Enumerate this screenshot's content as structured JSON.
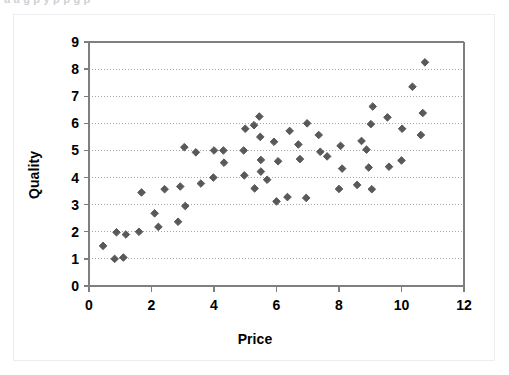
{
  "top_clipped_text": "a a g       p  y p      p      g p",
  "chart_data": {
    "type": "scatter",
    "title": "",
    "xlabel": "Price",
    "ylabel": "Quality",
    "xlim": [
      0,
      12
    ],
    "ylim": [
      0,
      9
    ],
    "xticks": [
      0,
      2,
      4,
      6,
      8,
      10,
      12
    ],
    "xtick_labels": [
      "0",
      "2",
      "4",
      "6",
      "8",
      "10",
      "12"
    ],
    "yticks": [
      0,
      1,
      2,
      3,
      4,
      5,
      6,
      7,
      8,
      9
    ],
    "ytick_labels": [
      "0",
      "1",
      "2",
      "3",
      "4",
      "5",
      "6",
      "7",
      "8",
      "9"
    ],
    "grid": "horizontal-dotted",
    "legend": null,
    "marker": "diamond",
    "marker_color": "#595959",
    "marker_size": 6,
    "axis_color": "#808080",
    "grid_color": "#a6a6a6",
    "points": [
      [
        0.45,
        1.48
      ],
      [
        0.82,
        1.0
      ],
      [
        0.88,
        1.98
      ],
      [
        1.1,
        1.05
      ],
      [
        1.18,
        1.9
      ],
      [
        1.6,
        2.0
      ],
      [
        1.68,
        3.45
      ],
      [
        2.1,
        2.68
      ],
      [
        2.22,
        2.18
      ],
      [
        2.42,
        3.57
      ],
      [
        2.85,
        2.37
      ],
      [
        2.92,
        3.67
      ],
      [
        3.05,
        5.12
      ],
      [
        3.08,
        2.95
      ],
      [
        3.42,
        4.93
      ],
      [
        3.58,
        3.78
      ],
      [
        3.98,
        4.0
      ],
      [
        4.0,
        5.0
      ],
      [
        4.3,
        5.0
      ],
      [
        4.32,
        4.55
      ],
      [
        4.95,
        5.0
      ],
      [
        4.97,
        4.08
      ],
      [
        5.0,
        5.8
      ],
      [
        5.28,
        5.93
      ],
      [
        5.3,
        3.6
      ],
      [
        5.45,
        6.25
      ],
      [
        5.48,
        5.5
      ],
      [
        5.5,
        4.65
      ],
      [
        5.5,
        4.22
      ],
      [
        5.7,
        3.92
      ],
      [
        5.92,
        5.32
      ],
      [
        6.0,
        3.12
      ],
      [
        6.05,
        4.6
      ],
      [
        6.35,
        3.28
      ],
      [
        6.42,
        5.72
      ],
      [
        6.7,
        5.22
      ],
      [
        6.75,
        4.68
      ],
      [
        6.95,
        3.25
      ],
      [
        6.98,
        6.0
      ],
      [
        7.35,
        5.57
      ],
      [
        7.4,
        4.95
      ],
      [
        7.62,
        4.78
      ],
      [
        8.0,
        3.58
      ],
      [
        8.05,
        5.17
      ],
      [
        8.1,
        4.33
      ],
      [
        8.58,
        3.73
      ],
      [
        8.72,
        5.35
      ],
      [
        8.88,
        5.03
      ],
      [
        8.95,
        4.37
      ],
      [
        9.02,
        5.97
      ],
      [
        9.05,
        3.57
      ],
      [
        9.08,
        6.62
      ],
      [
        9.55,
        6.22
      ],
      [
        9.6,
        4.4
      ],
      [
        10.0,
        4.63
      ],
      [
        10.02,
        5.8
      ],
      [
        10.35,
        7.35
      ],
      [
        10.62,
        5.57
      ],
      [
        10.68,
        6.38
      ],
      [
        10.75,
        8.25
      ]
    ]
  }
}
